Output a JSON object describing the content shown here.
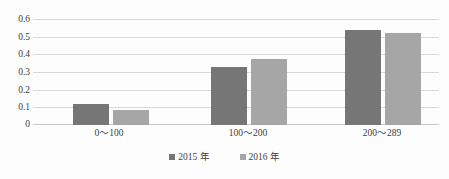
{
  "chart_data": {
    "type": "bar",
    "title": "",
    "xlabel": "",
    "ylabel": "",
    "categories": [
      "0～100",
      "100～200",
      "200～289"
    ],
    "series": [
      {
        "name": "2015 年",
        "color": "#767676",
        "values": [
          0.12,
          0.33,
          0.54
        ]
      },
      {
        "name": "2016 年",
        "color": "#a6a6a6",
        "values": [
          0.085,
          0.375,
          0.52
        ]
      }
    ],
    "ylim": [
      0,
      0.6
    ],
    "ytick_values": [
      0.6,
      0.5,
      0.4,
      0.3,
      0.2,
      0.1,
      0
    ],
    "ytick_labels": [
      "0.6",
      "0.5",
      "0.4",
      "0.3",
      "0.2",
      "0.1",
      "0"
    ],
    "grid": "horizontal",
    "legend_position": "bottom-center",
    "bar_group_layout": "clustered"
  },
  "axis": {
    "y_labels": [
      "0.6",
      "0.5",
      "0.4",
      "0.3",
      "0.2",
      "0.1",
      "0"
    ],
    "x_labels": [
      "0～100",
      "100～200",
      "200～289"
    ]
  },
  "legend": {
    "items": [
      {
        "label": "2015 年",
        "color": "#767676"
      },
      {
        "label": "2016 年",
        "color": "#a6a6a6"
      }
    ]
  },
  "header": {
    "cropped_text": ""
  },
  "colors": {
    "series_2015": "#767676",
    "series_2016": "#a6a6a6",
    "gridline": "#d9d9d9",
    "baseline": "#c8c8c8",
    "text": "#404040",
    "background": "#fdfdfd"
  }
}
